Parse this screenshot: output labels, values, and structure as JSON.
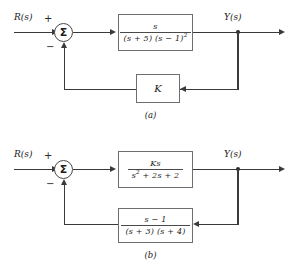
{
  "figure": {
    "type": "control-system-block-diagrams",
    "count": 2
  },
  "diagrams": [
    {
      "id": "a",
      "caption": "(a)",
      "input_label": "R(s)",
      "output_label": "Y(s)",
      "summing_junction": {
        "symbol": "Σ",
        "input_sign": "+",
        "feedback_sign": "−"
      },
      "forward_block": {
        "name": "plant",
        "numerator": "s",
        "denominator_terms": [
          "(s + 5)",
          "(s − 1)"
        ],
        "denominator_exponent": "2",
        "expression": "s / [(s + 5)(s − 1)²]"
      },
      "feedback_block": {
        "name": "gain",
        "label": "K",
        "expression": "K"
      }
    },
    {
      "id": "b",
      "caption": "(b)",
      "input_label": "R(s)",
      "output_label": "Y(s)",
      "summing_junction": {
        "symbol": "Σ",
        "input_sign": "+",
        "feedback_sign": "−"
      },
      "forward_block": {
        "name": "plant",
        "numerator": "Ks",
        "denominator": "s² + 2s + 2",
        "denominator_lead": "s",
        "denominator_exponent": "2",
        "denominator_rest": "+ 2s + 2",
        "expression": "Ks / (s² + 2s + 2)"
      },
      "feedback_block": {
        "name": "compensator",
        "numerator": "s − 1",
        "denominator_terms": [
          "(s + 3)",
          "(s + 4)"
        ],
        "expression": "(s − 1) / [(s + 3)(s + 4)]"
      }
    }
  ],
  "style": {
    "line_color": "#3a3a3a",
    "block_border_color": "#6e6e6e",
    "background": "#ffffff",
    "text_color": "#1a1a1a"
  }
}
